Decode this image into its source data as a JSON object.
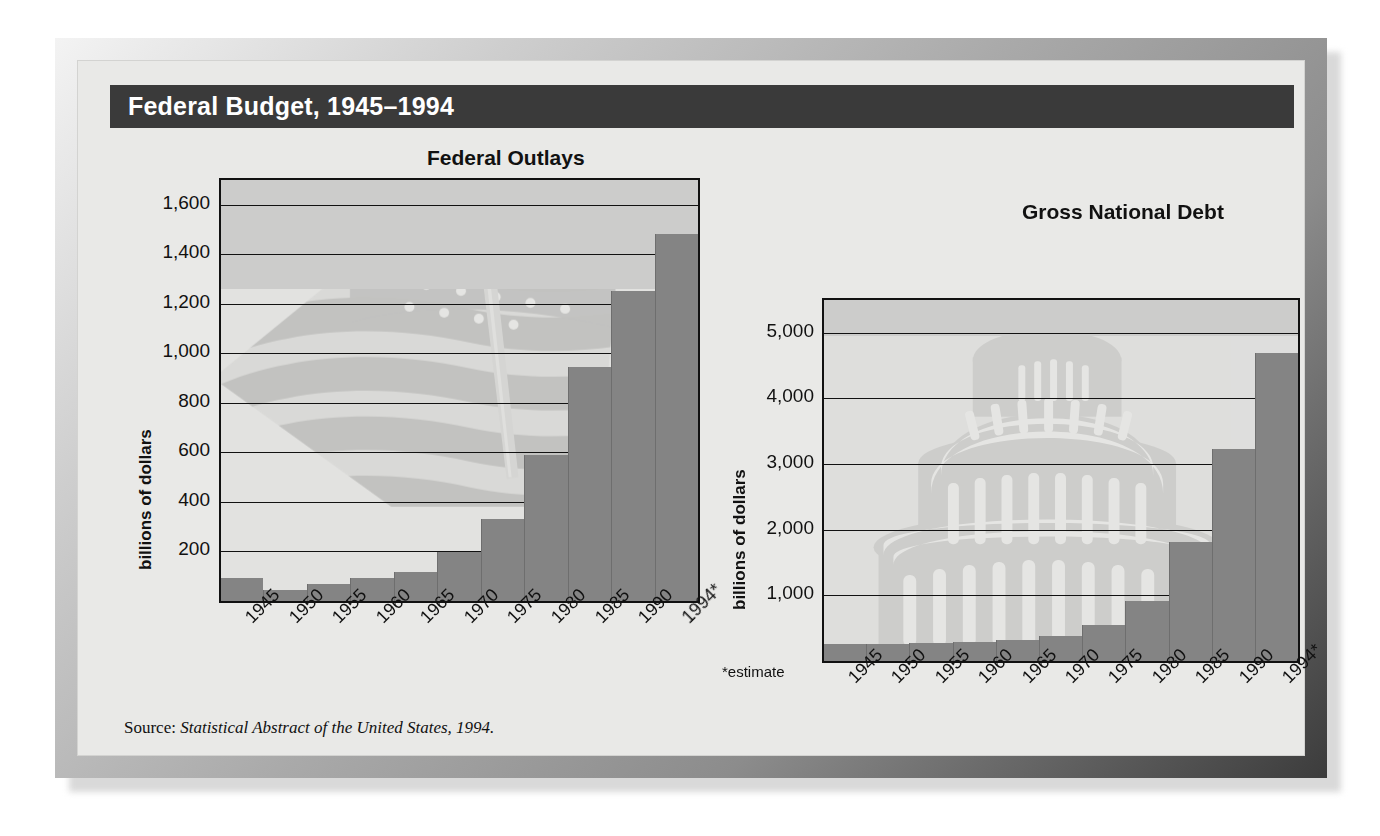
{
  "figure": {
    "title": "Federal Budget, 1945–1994",
    "source_prefix": "Source: ",
    "source_italic": "Statistical Abstract of the United States, 1994.",
    "estimate_note": "*estimate",
    "colors": {
      "title_bar": "#3a3a3a",
      "title_text": "#ffffff",
      "bar": "#848484",
      "plot_bg": "#e2e2e0",
      "panel_bg": "#e9e9e7",
      "gridline": "#111111",
      "frame_light": "#cfcfcf",
      "frame_dark": "#3c3c3c"
    }
  },
  "chart_data": [
    {
      "type": "bar",
      "title": "Federal Outlays",
      "xlabel": "",
      "ylabel": "billions of dollars",
      "ylim": [
        0,
        1700
      ],
      "yticks": [
        200,
        400,
        600,
        800,
        1000,
        1200,
        1400,
        1600
      ],
      "ytick_labels": [
        "200",
        "400",
        "600",
        "800",
        "1,000",
        "1,200",
        "1,400",
        "1,600"
      ],
      "grid": true,
      "legend": "none",
      "categories": [
        "1945",
        "1950",
        "1955",
        "1960",
        "1965",
        "1970",
        "1975",
        "1980",
        "1985",
        "1990",
        "1994*"
      ],
      "values": [
        93,
        43,
        68,
        92,
        118,
        196,
        332,
        591,
        946,
        1253,
        1484
      ]
    },
    {
      "type": "bar",
      "title": "Gross National Debt",
      "xlabel": "",
      "ylabel": "billions of dollars",
      "ylim": [
        0,
        5500
      ],
      "yticks": [
        1000,
        2000,
        3000,
        4000,
        5000
      ],
      "ytick_labels": [
        "1,000",
        "2,000",
        "3,000",
        "4,000",
        "5,000"
      ],
      "grid": true,
      "legend": "none",
      "categories": [
        "1945",
        "1950",
        "1955",
        "1960",
        "1965",
        "1970",
        "1975",
        "1980",
        "1985",
        "1990",
        "1994*"
      ],
      "values": [
        259,
        257,
        274,
        291,
        323,
        381,
        542,
        909,
        1817,
        3233,
        4694
      ]
    }
  ]
}
